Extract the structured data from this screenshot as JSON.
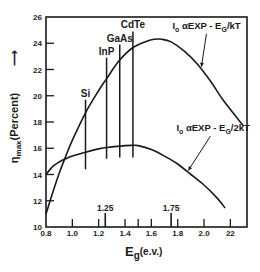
{
  "chart_data": {
    "type": "line",
    "title": "",
    "xlabel": "E",
    "xlabel_sub": "g",
    "xlabel_unit": "(e.v.)",
    "ylabel": "η",
    "ylabel_sub": "max",
    "ylabel_unit": "(Percent)",
    "ylabel_arrow": "⟶",
    "xlim": [
      0.8,
      2.3
    ],
    "ylim": [
      10,
      26
    ],
    "grid": false,
    "xticks": [
      0.8,
      1.0,
      1.2,
      1.4,
      1.6,
      1.8,
      2.0,
      2.2
    ],
    "xtick_labels": [
      "0.8",
      "1.0",
      "1.2",
      "1.4",
      "1.6",
      "1.8",
      "2.0",
      "22"
    ],
    "xminor_ticks": [
      1.5
    ],
    "yticks": [
      10,
      12,
      14,
      16,
      18,
      20,
      22,
      24,
      26
    ],
    "ytick_labels": [
      "10",
      "12",
      "14",
      "16",
      "18",
      "20",
      "22",
      "24",
      "26"
    ],
    "marker_ticks": [
      {
        "x": 1.25,
        "label": "1.25"
      },
      {
        "x": 1.75,
        "label": "1.75"
      }
    ],
    "series": [
      {
        "name": "I₀ αEXP - E_G/kT",
        "label_main": "I",
        "label_sub": "o",
        "label_rest": " αEXP - E",
        "label_sub2": "G",
        "label_tail": "/kT",
        "x": [
          0.8,
          0.85,
          0.9,
          0.95,
          1.0,
          1.1,
          1.2,
          1.26,
          1.35,
          1.45,
          1.55,
          1.62,
          1.68,
          1.75,
          1.85,
          1.95,
          2.05,
          2.15,
          2.3
        ],
        "y": [
          11.0,
          12.6,
          14.1,
          15.4,
          16.6,
          18.7,
          20.4,
          21.3,
          22.6,
          23.6,
          24.1,
          24.3,
          24.3,
          24.1,
          23.4,
          22.4,
          21.1,
          19.6,
          17.7
        ]
      },
      {
        "name": "I₀ αEXP - E_G/2kT",
        "label_main": "I",
        "label_sub": "o",
        "label_rest": " αEXP - E",
        "label_sub2": "G",
        "label_tail": "/2kT",
        "x": [
          0.8,
          0.85,
          0.9,
          0.95,
          1.0,
          1.1,
          1.2,
          1.3,
          1.4,
          1.45,
          1.5,
          1.6,
          1.7,
          1.8,
          1.9,
          2.0,
          2.1,
          2.16
        ],
        "y": [
          14.0,
          14.6,
          14.95,
          15.2,
          15.4,
          15.7,
          15.95,
          16.1,
          16.2,
          16.22,
          16.2,
          15.9,
          15.4,
          14.8,
          14.0,
          13.2,
          12.2,
          11.45
        ]
      }
    ],
    "materials": [
      {
        "name": "Si",
        "x": 1.1,
        "y_top": 19.7,
        "y_bottom": 14.4
      },
      {
        "name": "InP",
        "x": 1.26,
        "y_top": 22.9,
        "y_bottom": 15.2
      },
      {
        "name": "GaAs",
        "x": 1.36,
        "y_top": 23.9,
        "y_bottom": 15.3
      },
      {
        "name": "CdTe",
        "x": 1.46,
        "y_top": 24.9,
        "y_bottom": 15.3
      }
    ],
    "annotations": [
      {
        "series": 0,
        "text_anchor_x": 1.76,
        "text_anchor_y": 25.1,
        "arrow_to_x": 1.98,
        "arrow_to_y": 22.2
      },
      {
        "series": 1,
        "text_anchor_x": 1.79,
        "text_anchor_y": 17.3,
        "arrow_to_x": 1.88,
        "arrow_to_y": 14.3
      }
    ]
  }
}
